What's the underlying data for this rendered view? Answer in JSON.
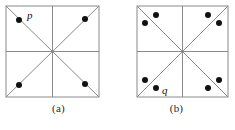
{
  "figure": {
    "background_color": "#ffffff",
    "line_color": "#8a8a8a",
    "border_color": "#8a8a8a",
    "point_color": "#111111",
    "point_radius": 3.0,
    "panels": [
      {
        "id": "a",
        "caption": "(a)",
        "square": {
          "x": 6,
          "y": 6,
          "width": 93,
          "height": 91
        },
        "lines": [
          "top-edge",
          "right-edge",
          "bottom-edge",
          "left-edge",
          "horizontal-midline",
          "vertical-midline",
          "diagonal-nw-se",
          "diagonal-sw-ne"
        ],
        "points": [
          {
            "name": "p",
            "label": "p",
            "cx": 19,
            "cy": 20,
            "label_dx": 7,
            "label_dy": -10
          },
          {
            "name": "point-top-right",
            "label": "",
            "cx": 85,
            "cy": 19
          },
          {
            "name": "point-bottom-left",
            "label": "",
            "cx": 19,
            "cy": 85
          },
          {
            "name": "point-bottom-right",
            "label": "",
            "cx": 85,
            "cy": 84
          }
        ]
      },
      {
        "id": "b",
        "caption": "(b)",
        "square": {
          "x": 19,
          "y": 6,
          "width": 91,
          "height": 91
        },
        "lines": [
          "top-edge",
          "right-edge",
          "bottom-edge",
          "left-edge",
          "horizontal-midline",
          "vertical-midline",
          "diagonal-nw-se",
          "diagonal-sw-ne"
        ],
        "points": [
          {
            "name": "point-top-left-outer",
            "label": "",
            "cx": 27,
            "cy": 23
          },
          {
            "name": "point-top-left-inner",
            "label": "",
            "cx": 38,
            "cy": 15
          },
          {
            "name": "point-top-right-inner",
            "label": "",
            "cx": 90,
            "cy": 15
          },
          {
            "name": "point-top-right-outer",
            "label": "",
            "cx": 101,
            "cy": 23
          },
          {
            "name": "point-bottom-left-outer",
            "label": "",
            "cx": 27,
            "cy": 80
          },
          {
            "name": "q",
            "label": "q",
            "cx": 38,
            "cy": 88,
            "label_dx": 6,
            "label_dy": -4
          },
          {
            "name": "point-bottom-right-inner",
            "label": "",
            "cx": 90,
            "cy": 88
          },
          {
            "name": "point-bottom-right-outer",
            "label": "",
            "cx": 101,
            "cy": 80
          }
        ]
      }
    ]
  }
}
